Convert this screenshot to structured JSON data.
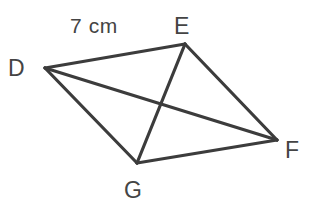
{
  "figure": {
    "name": "quadrilateral-defg",
    "background_color": "#ffffff",
    "stroke_color": "#3c3c3c",
    "text_color": "#444444",
    "stroke_width": 3.2,
    "width": 315,
    "height": 208
  },
  "vertices": [
    {
      "id": "D",
      "label": "D",
      "x": 45,
      "y": 68,
      "label_x": 8,
      "label_y": 76
    },
    {
      "id": "E",
      "label": "E",
      "x": 185,
      "y": 44,
      "label_x": 174,
      "label_y": 34
    },
    {
      "id": "F",
      "label": "F",
      "x": 277,
      "y": 140,
      "label_x": 285,
      "label_y": 158
    },
    {
      "id": "G",
      "label": "G",
      "x": 137,
      "y": 163,
      "label_x": 124,
      "label_y": 198
    }
  ],
  "edges": [
    {
      "id": "DE",
      "from": "D",
      "to": "E",
      "x1": 45,
      "y1": 68,
      "x2": 185,
      "y2": 44
    },
    {
      "id": "EF",
      "from": "E",
      "to": "F",
      "x1": 185,
      "y1": 44,
      "x2": 277,
      "y2": 140
    },
    {
      "id": "FG",
      "from": "F",
      "to": "G",
      "x1": 277,
      "y1": 140,
      "x2": 137,
      "y2": 163
    },
    {
      "id": "GD",
      "from": "G",
      "to": "D",
      "x1": 137,
      "y1": 163,
      "x2": 45,
      "y2": 68
    }
  ],
  "diagonals": [
    {
      "id": "DF",
      "from": "D",
      "to": "F",
      "x1": 45,
      "y1": 68,
      "x2": 277,
      "y2": 140
    },
    {
      "id": "EG",
      "from": "E",
      "to": "G",
      "x1": 185,
      "y1": 44,
      "x2": 137,
      "y2": 163
    }
  ],
  "annotations": [
    {
      "id": "side-de-length",
      "text": "7 cm",
      "x": 70,
      "y": 33,
      "refers_to": "DE"
    }
  ]
}
